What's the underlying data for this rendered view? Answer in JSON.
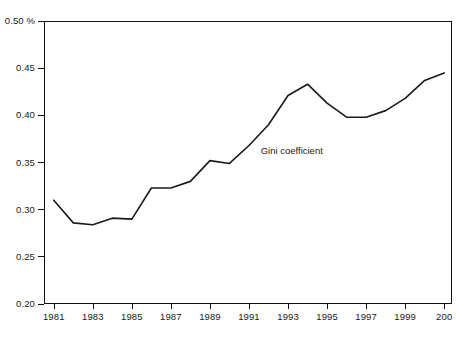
{
  "chart_data": {
    "type": "line",
    "title": "",
    "subtitle": "",
    "xlabel": "",
    "ylabel": "",
    "y_unit": "%",
    "xlim": [
      1980.5,
      2001.4
    ],
    "ylim": [
      0.2,
      0.5
    ],
    "grid": false,
    "legend": "none",
    "annotations": [
      {
        "text": "Gini coefficient",
        "x": 1991.6,
        "y": 0.362
      }
    ],
    "y_ticks": [
      {
        "value": 0.2,
        "label": "0.20"
      },
      {
        "value": 0.25,
        "label": "0.25"
      },
      {
        "value": 0.3,
        "label": "0.30"
      },
      {
        "value": 0.35,
        "label": "0.35"
      },
      {
        "value": 0.4,
        "label": "0.40"
      },
      {
        "value": 0.45,
        "label": "0.45"
      },
      {
        "value": 0.5,
        "label": "0.50"
      }
    ],
    "x_ticks": [
      {
        "value": 1981,
        "label": "1981"
      },
      {
        "value": 1983,
        "label": "1983"
      },
      {
        "value": 1985,
        "label": "1985"
      },
      {
        "value": 1987,
        "label": "1987"
      },
      {
        "value": 1989,
        "label": "1989"
      },
      {
        "value": 1991,
        "label": "1991"
      },
      {
        "value": 1993,
        "label": "1993"
      },
      {
        "value": 1995,
        "label": "1995"
      },
      {
        "value": 1997,
        "label": "1997"
      },
      {
        "value": 1999,
        "label": "1999"
      },
      {
        "value": 2001,
        "label": "200"
      }
    ],
    "categories": [
      1981,
      1982,
      1983,
      1984,
      1985,
      1986,
      1987,
      1988,
      1989,
      1990,
      1991,
      1992,
      1993,
      1994,
      1995,
      1996,
      1997,
      1998,
      1999,
      2000,
      2001
    ],
    "series": [
      {
        "name": "Gini coefficient",
        "color": "#1a1a1a",
        "values": [
          0.31,
          0.286,
          0.284,
          0.291,
          0.29,
          0.323,
          0.323,
          0.33,
          0.352,
          0.349,
          0.368,
          0.39,
          0.421,
          0.433,
          0.413,
          0.398,
          0.398,
          0.405,
          0.418,
          0.437,
          0.445
        ]
      }
    ]
  },
  "style": {
    "line_color": "#1a1a1a",
    "axis_color": "#111111",
    "text_color": "#1a1a1a",
    "background": "#ffffff"
  }
}
